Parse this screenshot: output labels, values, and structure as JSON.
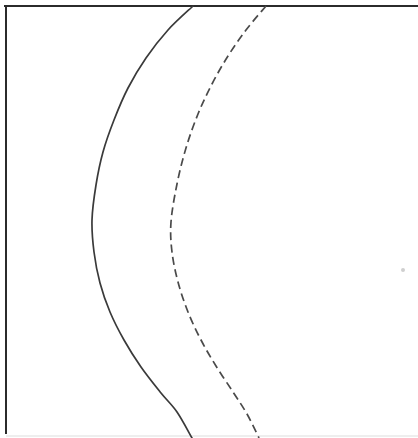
{
  "figure": {
    "background_color": "#ffffff",
    "width": 418,
    "height": 438,
    "caption": ""
  },
  "frame": {
    "stroke_color": "#2b2b2b",
    "stroke_width": 2,
    "top_border": {
      "x1": 5,
      "y1": 6,
      "x2": 418,
      "y2": 6
    },
    "left_border": {
      "x1": 6,
      "y1": 6,
      "x2": 6,
      "y2": 433
    },
    "bottom_faint": {
      "x1": 6,
      "y1": 436,
      "x2": 418,
      "y2": 436,
      "color": "#e8e8e8"
    }
  },
  "chart_data": {
    "type": "line",
    "title": "",
    "xlabel": "",
    "ylabel": "",
    "xlim": [
      0,
      418
    ],
    "ylim": [
      0,
      438
    ],
    "grid": false,
    "legend_position": "none",
    "series": [
      {
        "name": "solid-curve",
        "style": "solid",
        "color": "#3a3a3a",
        "stroke_width": 1.7,
        "vertex": {
          "x": 92,
          "y": 220
        },
        "points": [
          {
            "x": 193,
            "y": 6
          },
          {
            "x": 168,
            "y": 30
          },
          {
            "x": 146,
            "y": 58
          },
          {
            "x": 128,
            "y": 88
          },
          {
            "x": 114,
            "y": 120
          },
          {
            "x": 103,
            "y": 152
          },
          {
            "x": 96,
            "y": 185
          },
          {
            "x": 92,
            "y": 220
          },
          {
            "x": 94,
            "y": 252
          },
          {
            "x": 100,
            "y": 283
          },
          {
            "x": 110,
            "y": 312
          },
          {
            "x": 124,
            "y": 340
          },
          {
            "x": 141,
            "y": 367
          },
          {
            "x": 161,
            "y": 393
          },
          {
            "x": 177,
            "y": 412
          },
          {
            "x": 192,
            "y": 438
          }
        ]
      },
      {
        "name": "dashed-curve",
        "style": "dashed",
        "color": "#4a4a4a",
        "stroke_width": 1.7,
        "dash_length": 8,
        "gap_length": 4.5,
        "vertex": {
          "x": 171,
          "y": 222
        },
        "points": [
          {
            "x": 266,
            "y": 6
          },
          {
            "x": 246,
            "y": 30
          },
          {
            "x": 228,
            "y": 56
          },
          {
            "x": 212,
            "y": 84
          },
          {
            "x": 198,
            "y": 114
          },
          {
            "x": 186,
            "y": 148
          },
          {
            "x": 177,
            "y": 184
          },
          {
            "x": 171,
            "y": 222
          },
          {
            "x": 172,
            "y": 252
          },
          {
            "x": 178,
            "y": 282
          },
          {
            "x": 188,
            "y": 312
          },
          {
            "x": 201,
            "y": 340
          },
          {
            "x": 216,
            "y": 366
          },
          {
            "x": 233,
            "y": 392
          },
          {
            "x": 247,
            "y": 414
          },
          {
            "x": 259,
            "y": 438
          }
        ]
      }
    ]
  },
  "artifacts": [
    {
      "name": "scan-speck",
      "x": 403,
      "y": 270,
      "radius": 2,
      "color": "#cfcfcf"
    }
  ]
}
